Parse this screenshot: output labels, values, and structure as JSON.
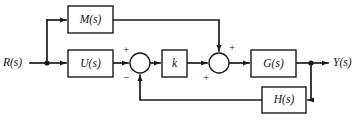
{
  "diagram": {
    "type": "control-system-block-diagram",
    "title": "",
    "background_color": "#ffffff",
    "line_color": "#1a1a1a",
    "inputs": [
      {
        "name": "reference-input",
        "label": "R(s)"
      }
    ],
    "outputs": [
      {
        "name": "system-output",
        "label": "Y(s)"
      }
    ],
    "blocks": [
      {
        "name": "feedforward-block-m",
        "label": "M(s)",
        "x": 68,
        "y": 6,
        "w": 45,
        "h": 27
      },
      {
        "name": "controller-block-u",
        "label": "U(s)",
        "x": 68,
        "y": 50,
        "w": 45,
        "h": 27
      },
      {
        "name": "gain-block-k",
        "label": "k",
        "x": 162,
        "y": 50,
        "w": 25,
        "h": 27
      },
      {
        "name": "plant-block-g",
        "label": "G(s)",
        "x": 251,
        "y": 50,
        "w": 45,
        "h": 27
      },
      {
        "name": "feedback-block-h",
        "label": "H(s)",
        "x": 262,
        "y": 87,
        "w": 44,
        "h": 26
      }
    ],
    "summing_junctions": [
      {
        "name": "summing-junction-1",
        "cx": 140,
        "cy": 63,
        "r": 10,
        "signs": [
          {
            "label": "+",
            "position": "top-left",
            "x": 126,
            "y": 50
          },
          {
            "label": "−",
            "position": "bottom-left",
            "x": 126,
            "y": 78
          }
        ]
      },
      {
        "name": "summing-junction-2",
        "cx": 219,
        "cy": 63,
        "r": 10,
        "signs": [
          {
            "label": "+",
            "position": "top-right",
            "x": 232,
            "y": 48
          },
          {
            "label": "+",
            "position": "bottom-left",
            "x": 206,
            "y": 78
          }
        ]
      }
    ],
    "junction_dots": [
      {
        "name": "input-branch-dot",
        "x": 47,
        "y": 63
      },
      {
        "name": "output-branch-dot",
        "x": 311,
        "y": 63
      }
    ],
    "signal_paths": [
      {
        "name": "path-r-to-branch",
        "description": "R(s) to input branch point"
      },
      {
        "name": "path-branch-to-m",
        "description": "input branch up into M(s)"
      },
      {
        "name": "path-branch-to-u",
        "description": "input branch into U(s)"
      },
      {
        "name": "path-m-to-sum2",
        "description": "M(s) output across top, down into summing junction 2 (+)"
      },
      {
        "name": "path-u-to-sum1",
        "description": "U(s) output into summing junction 1 (+)"
      },
      {
        "name": "path-sum1-to-k",
        "description": "summing junction 1 into gain k"
      },
      {
        "name": "path-k-to-sum2",
        "description": "gain k into summing junction 2 (+)"
      },
      {
        "name": "path-sum2-to-g",
        "description": "summing junction 2 into G(s)"
      },
      {
        "name": "path-g-to-y",
        "description": "G(s) to Y(s) output with branch dot"
      },
      {
        "name": "path-y-to-h",
        "description": "output branch down and left into H(s)"
      },
      {
        "name": "path-h-to-sum1",
        "description": "H(s) output left then up into summing junction 1 (−)"
      }
    ]
  }
}
